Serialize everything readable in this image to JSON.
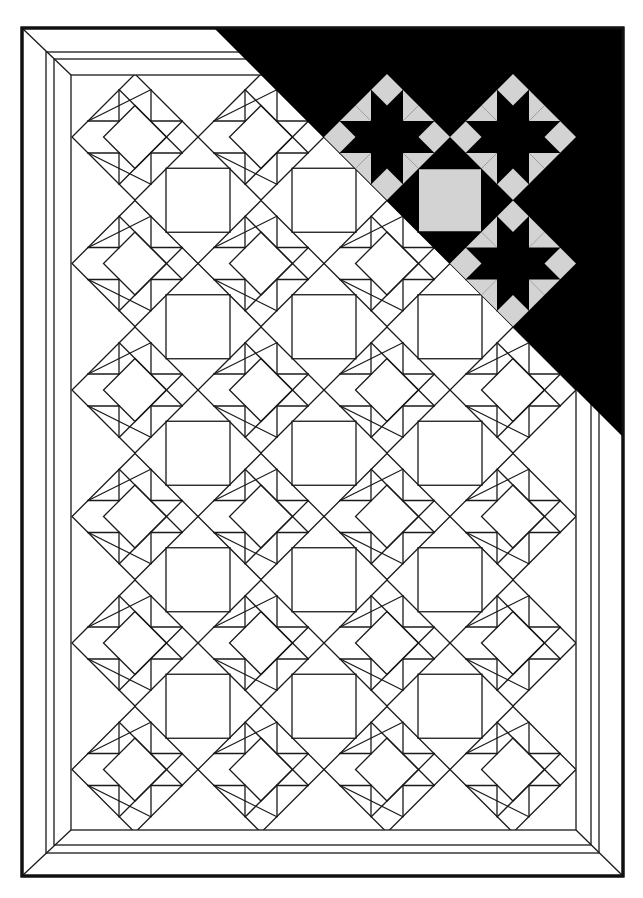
{
  "title": "Quilt pattern: diagonal star blocks with plain setting squares and mitered borders",
  "canvas": {
    "width": 643,
    "height": 898,
    "background": "#ffffff"
  },
  "colors": {
    "line": "#1a1a1a",
    "frame": "#111111",
    "dark_fill": "#000000",
    "light_fill": "#d3d3d3"
  },
  "borders": [
    {
      "name": "outer-border",
      "x1": 22,
      "y1": 28,
      "x2": 623,
      "y2": 876,
      "weight": 3
    },
    {
      "name": "border-2",
      "x1": 46,
      "y1": 52,
      "x2": 599,
      "y2": 853,
      "weight": 1.3
    },
    {
      "name": "border-3",
      "x1": 54,
      "y1": 59,
      "x2": 591,
      "y2": 845,
      "weight": 1.3
    },
    {
      "name": "inner-border",
      "x1": 71,
      "y1": 75,
      "x2": 576,
      "y2": 830,
      "weight": 1.3
    }
  ],
  "star_grid": {
    "origin_x": 135,
    "origin_y": 137,
    "step_x": 126,
    "step_y": 126.5,
    "cols": 4,
    "rows": 6,
    "outer_half_diagonal": 63,
    "inner_half_diagonal": 31.5,
    "square_offset": 16
  },
  "setting_squares": {
    "cols": 3,
    "rows": 5,
    "half_size": 32
  },
  "shaded_corner": {
    "triangle": [
      [
        214,
        28
      ],
      [
        623,
        28
      ],
      [
        623,
        437
      ]
    ],
    "colored_stars": [
      {
        "col": 2,
        "row": 0
      },
      {
        "col": 3,
        "row": 0
      },
      {
        "col": 3,
        "row": 1
      }
    ],
    "colored_squares": [
      {
        "col": 2,
        "row": 0
      }
    ]
  }
}
